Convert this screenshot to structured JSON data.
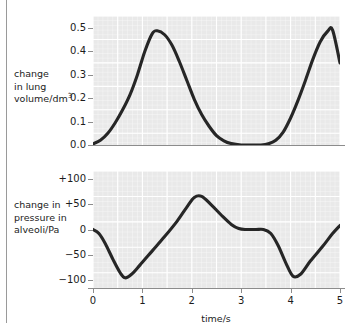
{
  "figure": {
    "background_color": "#ffffff",
    "plot_background_color": "#e9e9e9",
    "grid_color": "#ffffff",
    "curve_color": "#262626",
    "axis_color": "#8c8c8c"
  },
  "chart_data": [
    {
      "type": "line",
      "id": "lung-volume",
      "title": "",
      "xlabel": "time/s",
      "ylabel": "change in lung volume/dm3",
      "ylabel_lines": [
        "change",
        "in lung",
        "volume/dm"
      ],
      "ylabel_superscript": "3",
      "xlim": [
        0,
        5
      ],
      "ylim": [
        0.0,
        0.55
      ],
      "yticks": [
        0.0,
        0.1,
        0.2,
        0.3,
        0.4,
        0.5
      ],
      "ytick_labels": [
        "0.0",
        "0.1",
        "0.2",
        "0.3",
        "0.4",
        "0.5"
      ],
      "xticks": [
        0,
        1,
        2,
        3,
        4,
        5
      ],
      "xtick_labels": [
        "0",
        "1",
        "2",
        "3",
        "4",
        "5"
      ],
      "xtick_labels_visible": false,
      "grid": true,
      "legend": "none",
      "x": [
        0.0,
        0.15,
        0.3,
        0.45,
        0.6,
        0.75,
        0.9,
        1.05,
        1.2,
        1.3,
        1.45,
        1.6,
        1.75,
        1.9,
        2.05,
        2.2,
        2.35,
        2.5,
        2.65,
        2.8,
        3.0,
        3.2,
        3.4,
        3.55,
        3.7,
        3.85,
        4.0,
        4.15,
        4.3,
        4.45,
        4.6,
        4.75,
        4.85,
        5.0
      ],
      "values": [
        0.005,
        0.02,
        0.05,
        0.095,
        0.15,
        0.215,
        0.3,
        0.4,
        0.475,
        0.487,
        0.47,
        0.425,
        0.355,
        0.275,
        0.195,
        0.13,
        0.08,
        0.04,
        0.018,
        0.006,
        0.0,
        0.0,
        0.0,
        0.005,
        0.02,
        0.055,
        0.115,
        0.19,
        0.275,
        0.365,
        0.44,
        0.485,
        0.49,
        0.35
      ]
    },
    {
      "type": "line",
      "id": "alveolar-pressure",
      "title": "",
      "xlabel": "time/s",
      "ylabel": "change in pressure in alveoli/Pa",
      "ylabel_lines": [
        "change in",
        "pressure in",
        "alveoli/Pa"
      ],
      "xlim": [
        0,
        5
      ],
      "ylim": [
        -115,
        115
      ],
      "yticks": [
        100,
        50,
        0,
        -50,
        -100
      ],
      "ytick_labels": [
        "+100",
        "+50",
        "0",
        "−50",
        "−100"
      ],
      "xticks": [
        0,
        1,
        2,
        3,
        4,
        5
      ],
      "xtick_labels": [
        "0",
        "1",
        "2",
        "3",
        "4",
        "5"
      ],
      "xtick_labels_visible": true,
      "grid": true,
      "legend": "none",
      "x": [
        0.0,
        0.12,
        0.25,
        0.4,
        0.55,
        0.65,
        0.78,
        0.95,
        1.2,
        1.45,
        1.7,
        1.9,
        2.05,
        2.2,
        2.4,
        2.6,
        2.8,
        2.95,
        3.1,
        3.3,
        3.45,
        3.6,
        3.75,
        3.9,
        4.05,
        4.2,
        4.4,
        4.65,
        4.85,
        5.0
      ],
      "values": [
        0.0,
        -8,
        -28,
        -58,
        -85,
        -95,
        -88,
        -70,
        -42,
        -14,
        16,
        44,
        63,
        65,
        48,
        28,
        10,
        2,
        0,
        0,
        0,
        -8,
        -32,
        -65,
        -92,
        -88,
        -62,
        -33,
        -8,
        8
      ]
    }
  ]
}
